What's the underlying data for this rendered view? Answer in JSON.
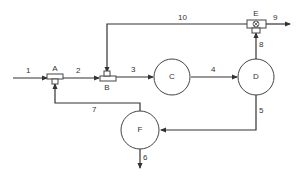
{
  "diagram": {
    "type": "process-flow",
    "nodes": [
      {
        "id": "A",
        "label": "A",
        "kind": "mixer-tee"
      },
      {
        "id": "B",
        "label": "B",
        "kind": "mixer-tee"
      },
      {
        "id": "C",
        "label": "C",
        "kind": "unit"
      },
      {
        "id": "D",
        "label": "D",
        "kind": "unit"
      },
      {
        "id": "E",
        "label": "E",
        "kind": "splitter-valve"
      },
      {
        "id": "F",
        "label": "F",
        "kind": "unit"
      }
    ],
    "streams": [
      {
        "id": "1",
        "label": "1",
        "from": "feed",
        "to": "A"
      },
      {
        "id": "2",
        "label": "2",
        "from": "A",
        "to": "B"
      },
      {
        "id": "3",
        "label": "3",
        "from": "B",
        "to": "C"
      },
      {
        "id": "4",
        "label": "4",
        "from": "C",
        "to": "D"
      },
      {
        "id": "5",
        "label": "5",
        "from": "D",
        "to": "F"
      },
      {
        "id": "6",
        "label": "6",
        "from": "F",
        "to": "out"
      },
      {
        "id": "7",
        "label": "7",
        "from": "F",
        "to": "A"
      },
      {
        "id": "8",
        "label": "8",
        "from": "D",
        "to": "E"
      },
      {
        "id": "9",
        "label": "9",
        "from": "E",
        "to": "out"
      },
      {
        "id": "10",
        "label": "10",
        "from": "E",
        "to": "B"
      }
    ]
  }
}
